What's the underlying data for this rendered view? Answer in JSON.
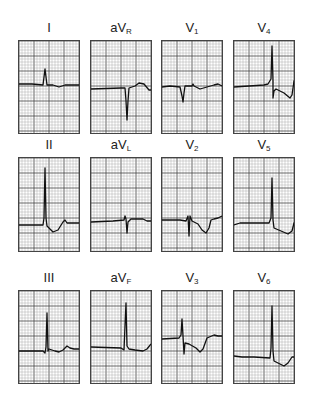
{
  "figure": {
    "grid_color": "#555555",
    "trace_color": "#111111"
  },
  "leads": [
    {
      "id": "I",
      "label": "I",
      "sub": "",
      "x": 18,
      "y": 40,
      "h": 92,
      "baseline": 43,
      "path": "M0,43 L13,43 L24,44 L25,36 L26,28 L27,36 L28,44 L34,44 L40,46 L46,44 L60,44"
    },
    {
      "id": "aVR",
      "label": "aV",
      "sub": "R",
      "x": 90,
      "y": 40,
      "h": 92,
      "baseline": 48,
      "path": "M0,48 L30,47 L34,47 L35,60 L36,79 L37,60 L38,47 L44,45 L48,42 L53,43 L58,49 L60,49"
    },
    {
      "id": "V1",
      "label": "V",
      "sub": "1",
      "x": 161,
      "y": 40,
      "h": 92,
      "baseline": 45,
      "path": "M0,46 L8,45 L18,46 L20,55 L21,61 L22,52 L23,45 L30,45 L31,43 L32,45 L38,48 L45,46 L52,44 L56,43 L60,45"
    },
    {
      "id": "V4",
      "label": "V",
      "sub": "4",
      "x": 233,
      "y": 40,
      "h": 92,
      "baseline": 46,
      "path": "M0,46 L30,44 L34,43 L37,38 L38,5 L39,40 L39,57 L40,50 L42,48 L50,52 L56,57 L58,54 L60,40 L62,38"
    },
    {
      "id": "II",
      "label": "II",
      "sub": "",
      "x": 18,
      "y": 157,
      "h": 93,
      "baseline": 67,
      "path": "M0,67 L24,67 L25,60 L26,10 L27,60 L28,68 L34,74 L39,72 L44,64 L46,62 L48,65 L52,65 L60,65"
    },
    {
      "id": "aVL",
      "label": "aV",
      "sub": "L",
      "x": 90,
      "y": 157,
      "h": 93,
      "baseline": 63,
      "path": "M0,64 L22,63 L33,62 L34,58 L35,61 L36,75 L37,64 L40,61 L52,61 L56,63 L60,63"
    },
    {
      "id": "V2",
      "label": "V",
      "sub": "2",
      "x": 161,
      "y": 157,
      "h": 93,
      "baseline": 62,
      "path": "M0,62 L18,62 L24,63 L26,58 L27,78 L28,58 L30,63 L36,66 L40,72 L44,75 L47,70 L49,62 L52,61 L56,60 L60,58"
    },
    {
      "id": "V5",
      "label": "V",
      "sub": "5",
      "x": 233,
      "y": 157,
      "h": 93,
      "baseline": 65,
      "path": "M0,67 L6,65 L35,65 L37,60 L38,20 L39,62 L40,70 L47,73 L54,76 L58,73 L60,65 L62,63"
    },
    {
      "id": "III",
      "label": "III",
      "sub": "",
      "x": 18,
      "y": 290,
      "h": 92,
      "baseline": 60,
      "path": "M0,60 L24,60 L26,62 L27,56 L28,22 L29,60 L30,58 L36,60 L40,61 L44,59 L48,55 L51,57 L55,58 L60,58"
    },
    {
      "id": "aVF",
      "label": "aV",
      "sub": "F",
      "x": 90,
      "y": 290,
      "h": 92,
      "baseline": 56,
      "path": "M0,56 L30,57 L33,59 L34,35 L35,12 L36,55 L38,58 L44,59 L52,60 L56,58 L60,53"
    },
    {
      "id": "V3",
      "label": "V",
      "sub": "3",
      "x": 161,
      "y": 290,
      "h": 92,
      "baseline": 48,
      "path": "M0,48 L17,47 L19,44 L20,28 L21,45 L22,63 L23,52 L27,53 L34,57 L38,61 L41,58 L45,47 L52,44 L56,45 L60,45"
    },
    {
      "id": "V6",
      "label": "V",
      "sub": "6",
      "x": 233,
      "y": 290,
      "h": 92,
      "baseline": 67,
      "path": "M0,65 L8,66 L20,66 L36,67 L37,57 L38,15 L39,60 L40,70 L46,73 L50,75 L54,72 L58,66 L62,66"
    }
  ]
}
